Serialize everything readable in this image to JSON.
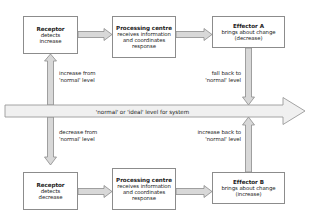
{
  "diagram": {
    "colors": {
      "background": "#ffffff",
      "box_border": "#8c8c8c",
      "box_fill": "#ffffff",
      "arrow_stroke": "#8c8c8c",
      "arrow_fill": "#d8d8d8",
      "band_fill": "#f0f0f0",
      "text": "#1b1b1b"
    },
    "nodes": {
      "receptor_top": {
        "title": "Receptor",
        "line1": "detects",
        "line2": "increase"
      },
      "processing_top": {
        "title": "Processing centre",
        "line1": "receives information",
        "line2": "and coordinates",
        "line3": "response"
      },
      "effector_a": {
        "title": "Effector A",
        "line1": "brings about change",
        "line2": "(decrease)"
      },
      "receptor_bottom": {
        "title": "Receptor",
        "line1": "detects",
        "line2": "decrease"
      },
      "processing_bottom": {
        "title": "Processing centre",
        "line1": "receives information",
        "line2": "and coordinates",
        "line3": "response"
      },
      "effector_b": {
        "title": "Effector B",
        "line1": "brings about change",
        "line2": "(increase)"
      }
    },
    "band": {
      "label": "'normal' or 'ideal' level for system"
    },
    "edge_labels": {
      "increase_from_normal": {
        "line1": "increase from",
        "line2": "'normal' level"
      },
      "fall_back_to_normal": {
        "line1": "fall back to",
        "line2": "'normal' level"
      },
      "decrease_from_normal": {
        "line1": "decrease from",
        "line2": "'normal' level"
      },
      "increase_back_to_normal": {
        "line1": "increase back to",
        "line2": "'normal' level"
      }
    }
  }
}
